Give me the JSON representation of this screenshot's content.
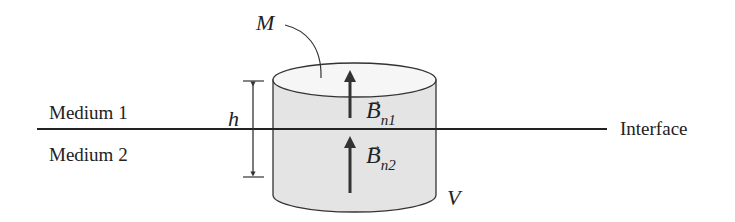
{
  "diagram": {
    "title": "",
    "labels": {
      "medium1": "Medium 1",
      "medium2": "Medium 2",
      "interface": "Interface",
      "height": "h",
      "surface": "M",
      "volume": "V"
    },
    "vectors": {
      "b1": {
        "symbol": "B",
        "subscript": "n1"
      },
      "b2": {
        "symbol": "B",
        "subscript": "n2"
      }
    },
    "colors": {
      "fill": "#e4e4e4",
      "stroke": "#333333"
    }
  }
}
